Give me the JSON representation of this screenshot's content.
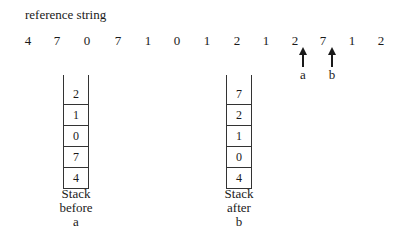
{
  "title": "reference string",
  "reference_string": [
    "4",
    "7",
    "0",
    "7",
    "1",
    "0",
    "1",
    "2",
    "1",
    "2",
    "7",
    "1",
    "2"
  ],
  "arrows": [
    {
      "label": "a",
      "after_index": 9
    },
    {
      "label": "b",
      "after_index": 10
    }
  ],
  "stacks": [
    {
      "name": "before-a",
      "cells": [
        "2",
        "1",
        "0",
        "7",
        "4"
      ],
      "caption": [
        "Stack",
        "before",
        "a"
      ]
    },
    {
      "name": "after-b",
      "cells": [
        "7",
        "2",
        "1",
        "0",
        "4"
      ],
      "caption": [
        "Stack",
        "after",
        "b"
      ]
    }
  ]
}
